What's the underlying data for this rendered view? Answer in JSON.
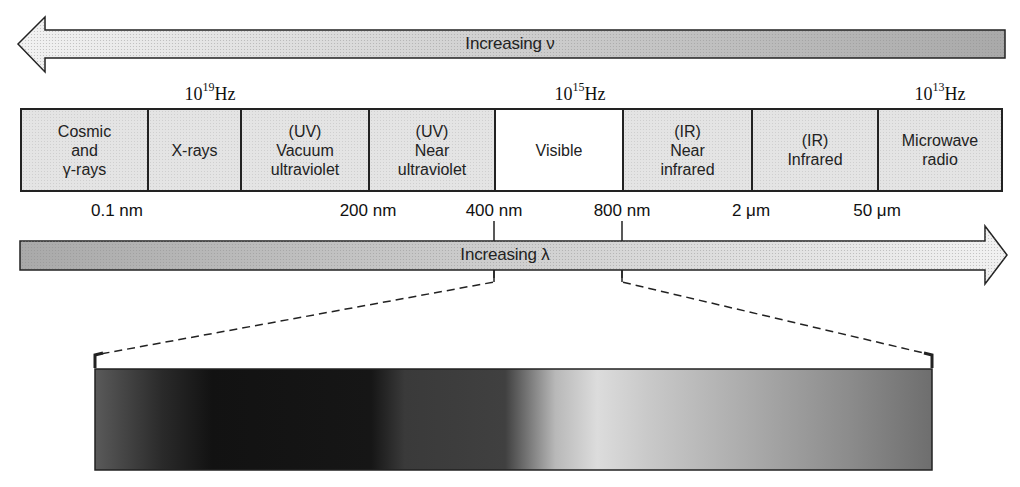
{
  "diagram": {
    "frequency_arrow": {
      "label": "Increasing ν",
      "direction": "left"
    },
    "wavelength_arrow": {
      "label": "Increasing λ",
      "direction": "right"
    },
    "frequency_labels": [
      {
        "base": "10",
        "exp": "19",
        "unit": "Hz",
        "x": 210
      },
      {
        "base": "10",
        "exp": "15",
        "unit": "Hz",
        "x": 580
      },
      {
        "base": "10",
        "exp": "13",
        "unit": "Hz",
        "x": 940
      }
    ],
    "bands": [
      {
        "label": "Cosmic\nand\nγ-rays",
        "width": 127
      },
      {
        "label": "X-rays",
        "width": 93
      },
      {
        "label": "(UV)\nVacuum\nultraviolet",
        "width": 128
      },
      {
        "label": "(UV)\nNear\nultraviolet",
        "width": 126
      },
      {
        "label": "Visible",
        "width": 128,
        "highlight": true
      },
      {
        "label": "(IR)\nNear\ninfrared",
        "width": 129
      },
      {
        "label": "(IR)\nInfrared",
        "width": 126
      },
      {
        "label": "Microwave\nradio",
        "width": 126
      }
    ],
    "wavelength_labels": [
      {
        "text": "0.1 nm",
        "x": 117
      },
      {
        "text": "200 nm",
        "x": 368
      },
      {
        "text": "400 nm",
        "x": 494
      },
      {
        "text": "800 nm",
        "x": 622
      },
      {
        "text": "2 μm",
        "x": 751
      },
      {
        "text": "50 μm",
        "x": 877
      }
    ],
    "visible_spectrum_bar": {
      "range_start": "400 nm",
      "range_end": "800 nm",
      "colors": {
        "dark": "#151515",
        "mid": "#3a3a3a",
        "light": "#d8d8d8",
        "end": "#7a7a7a"
      }
    }
  }
}
